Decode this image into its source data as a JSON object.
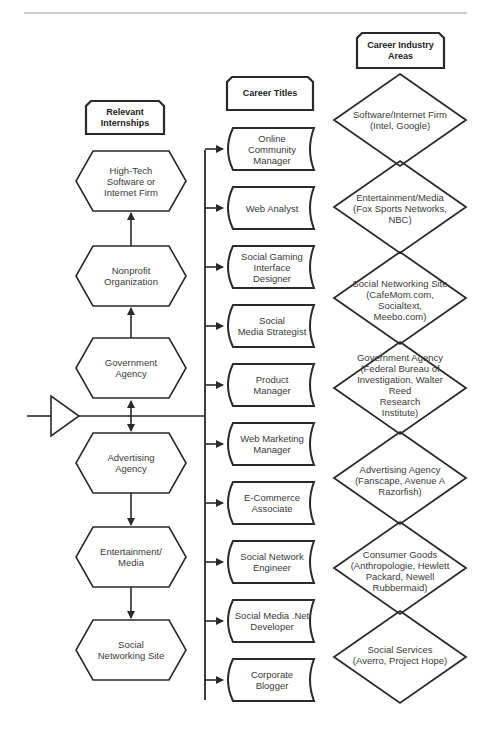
{
  "headers": {
    "internships": "Relevant\nInternships",
    "titles": "Career Titles",
    "industries": "Career Industry\nAreas"
  },
  "internships": [
    {
      "label": "High-Tech\nSoftware or\nInternet Firm"
    },
    {
      "label": "Nonprofit\nOrganization"
    },
    {
      "label": "Government\nAgency"
    },
    {
      "label": "Advertising\nAgency"
    },
    {
      "label": "Entertainment/\nMedia"
    },
    {
      "label": "Social\nNetworking Site"
    }
  ],
  "career_titles": [
    {
      "label": "Online\nCommunity\nManager"
    },
    {
      "label": "Web Analyst"
    },
    {
      "label": "Social Gaming\nInterface\nDesigner"
    },
    {
      "label": "Social\nMedia Strategist"
    },
    {
      "label": "Product\nManager"
    },
    {
      "label": "Web Marketing\nManager"
    },
    {
      "label": "E-Commerce\nAssociate"
    },
    {
      "label": "Social Network\nEngineer"
    },
    {
      "label": "Social Media .Net\nDeveloper"
    },
    {
      "label": "Corporate\nBlogger"
    }
  ],
  "industries": [
    {
      "label": "Software/Internet Firm\n(Intel, Google)"
    },
    {
      "label": "Entertainment/Media\n(Fox Sports Networks,\nNBC)"
    },
    {
      "label": "Social Networking Site\n(CafeMom.com, Socialtext,\nMeebo.com)"
    },
    {
      "label": "Government Agency\n(Federal Bureau of\nInvestigation, Walter Reed\nResearch\nInstitute)"
    },
    {
      "label": "Advertising Agency\n(Fanscape, Avenue A\nRazorfish)"
    },
    {
      "label": "Consumer Goods\n(Anthropologie, Hewlett\nPackard, Newell\nRubbermaid)"
    },
    {
      "label": "Social Services\n(Averro, Project Hope)"
    }
  ],
  "colors": {
    "stroke": "#2a2a2a",
    "header_rule": "#999999",
    "text": "#3a3a3a"
  }
}
